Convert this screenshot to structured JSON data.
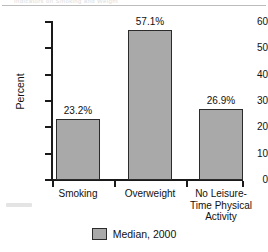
{
  "artifact": {
    "ghost_text": "Indicators on Smoking and Weight"
  },
  "chart_data": {
    "type": "bar",
    "title": "",
    "xlabel": "",
    "ylabel": "Percent",
    "ylim": [
      0,
      60
    ],
    "yticks": [
      "0",
      "10",
      "20",
      "30",
      "40",
      "50",
      "60"
    ],
    "grid": false,
    "legend_position": "bottom-center",
    "categories": [
      "Smoking",
      "Overweight",
      "No Leisure-\nTime Physical\nActivity"
    ],
    "category_lines": [
      [
        "Smoking"
      ],
      [
        "Overweight"
      ],
      [
        "No Leisure-",
        "Time Physical",
        "Activity"
      ]
    ],
    "values": [
      23.2,
      57.1,
      26.9
    ],
    "data_labels": [
      "23.2%",
      "57.1%",
      "26.9%"
    ],
    "series": [
      {
        "name": "Median, 2000",
        "values": [
          23.2,
          57.1,
          26.9
        ],
        "color": "#a9a9a9",
        "edge_color": "#2b2b2b"
      }
    ],
    "legend": [
      {
        "label": "Median, 2000",
        "color": "#a9a9a9"
      }
    ]
  }
}
